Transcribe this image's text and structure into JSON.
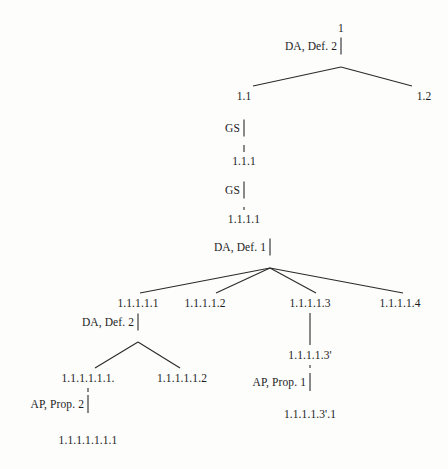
{
  "figure": {
    "type": "proof-derivation-tree",
    "background_color": "#fdfdfc",
    "ink_color": "#1c1c1c",
    "width": 448,
    "height": 469
  },
  "nodes": [
    {
      "id": "n1",
      "label": "1",
      "x": 341,
      "y": 28
    },
    {
      "id": "n11",
      "label": "1.1",
      "x": 244,
      "y": 96
    },
    {
      "id": "n12",
      "label": "1.2",
      "x": 424,
      "y": 96
    },
    {
      "id": "n111",
      "label": "1.1.1",
      "x": 244,
      "y": 161
    },
    {
      "id": "n1111",
      "label": "1.1.1.1",
      "x": 244,
      "y": 219
    },
    {
      "id": "n11111",
      "label": "1.1.1.1.1",
      "x": 138,
      "y": 303
    },
    {
      "id": "n11112",
      "label": "1.1.1.1.2",
      "x": 205,
      "y": 303
    },
    {
      "id": "n11113",
      "label": "1.1.1.1.3",
      "x": 310,
      "y": 303
    },
    {
      "id": "n11114",
      "label": "1.1.1.1.4",
      "x": 400,
      "y": 303
    },
    {
      "id": "n111111",
      "label": "1.1.1.1.1.1.",
      "x": 88,
      "y": 378
    },
    {
      "id": "n111112",
      "label": "1.1.1.1.1.2",
      "x": 182,
      "y": 378
    },
    {
      "id": "n1111111",
      "label": "1.1.1.1.1.1.1",
      "x": 88,
      "y": 440
    },
    {
      "id": "n11113p",
      "label": "1.1.1.1.3'",
      "x": 310,
      "y": 355
    },
    {
      "id": "n11113p1",
      "label": "1.1.1.1.3'.1",
      "x": 310,
      "y": 414
    }
  ],
  "rules": [
    {
      "id": "r1",
      "label": "DA, Def. 2",
      "bar_x": 341,
      "bar_y": 46,
      "bar_h": 17,
      "label_x": 337,
      "label_y": 46
    },
    {
      "id": "r2",
      "label": "GS",
      "bar_x": 244,
      "bar_y": 128,
      "bar_h": 17,
      "label_x": 240,
      "label_y": 128
    },
    {
      "id": "r3",
      "label": "GS",
      "bar_x": 244,
      "bar_y": 190,
      "bar_h": 17,
      "label_x": 240,
      "label_y": 190
    },
    {
      "id": "r4",
      "label": "DA, Def. 1",
      "bar_x": 270,
      "bar_y": 247,
      "bar_h": 17,
      "label_x": 266,
      "label_y": 247
    },
    {
      "id": "r5",
      "label": "DA, Def. 2",
      "bar_x": 138,
      "bar_y": 322,
      "bar_h": 17,
      "label_x": 134,
      "label_y": 322
    },
    {
      "id": "r6",
      "label": "AP, Prop. 2",
      "bar_x": 88,
      "bar_y": 404,
      "bar_h": 18,
      "label_x": 84,
      "label_y": 404
    },
    {
      "id": "r7",
      "label": "AP, Prop. 1",
      "bar_x": 310,
      "bar_y": 382,
      "bar_h": 18,
      "label_x": 306,
      "label_y": 382
    }
  ],
  "edges": [
    {
      "id": "e1",
      "from": "n1",
      "to": "n11",
      "x1": 341,
      "y1": 67,
      "x2": 253,
      "y2": 86
    },
    {
      "id": "e2",
      "from": "n1",
      "to": "n12",
      "x1": 341,
      "y1": 67,
      "x2": 412,
      "y2": 86
    },
    {
      "id": "e3",
      "from": "n11",
      "to": "n111",
      "x1": 244,
      "y1": 145,
      "x2": 244,
      "y2": 152
    },
    {
      "id": "e4",
      "from": "n111",
      "to": "n1111",
      "x1": 244,
      "y1": 207,
      "x2": 244,
      "y2": 210
    },
    {
      "id": "e5",
      "from": "n1111",
      "to": "n11111",
      "x1": 270,
      "y1": 268,
      "x2": 140,
      "y2": 293
    },
    {
      "id": "e6",
      "from": "n1111",
      "to": "n11112",
      "x1": 270,
      "y1": 268,
      "x2": 216,
      "y2": 293
    },
    {
      "id": "e7",
      "from": "n1111",
      "to": "n11113",
      "x1": 270,
      "y1": 268,
      "x2": 316,
      "y2": 293
    },
    {
      "id": "e8",
      "from": "n1111",
      "to": "n11114",
      "x1": 270,
      "y1": 268,
      "x2": 403,
      "y2": 293
    },
    {
      "id": "e9",
      "from": "n11111",
      "to": "n111111",
      "x1": 138,
      "y1": 342,
      "x2": 95,
      "y2": 368
    },
    {
      "id": "e10",
      "from": "n11111",
      "to": "n111112",
      "x1": 138,
      "y1": 342,
      "x2": 180,
      "y2": 368
    },
    {
      "id": "e11",
      "from": "n11113",
      "to": "n11113p",
      "x1": 310,
      "y1": 313,
      "x2": 310,
      "y2": 345
    },
    {
      "id": "e12",
      "from": "n11113p",
      "to": "n11113p1",
      "x1": 310,
      "y1": 365,
      "x2": 310,
      "y2": 368
    },
    {
      "id": "e13",
      "from": "n111111",
      "to": "n1111111",
      "x1": 88,
      "y1": 388,
      "x2": 88,
      "y2": 392
    }
  ]
}
